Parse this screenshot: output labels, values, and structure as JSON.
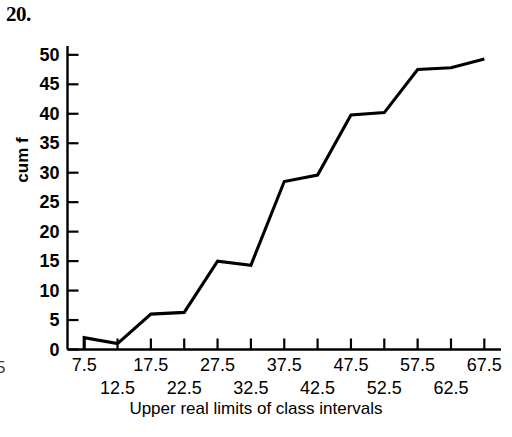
{
  "problem_number": "20.",
  "margin_artifact": "5",
  "chart_data": {
    "type": "line",
    "title": "",
    "xlabel": "Upper real limits of class intervals",
    "ylabel": "cum f",
    "x": [
      7.5,
      12.5,
      17.5,
      22.5,
      27.5,
      32.5,
      37.5,
      42.5,
      47.5,
      52.5,
      57.5,
      62.5,
      67.5
    ],
    "values": [
      2,
      1,
      6,
      6.3,
      15,
      14.3,
      28.5,
      29.6,
      39.8,
      40.2,
      47.5,
      47.8,
      49.3
    ],
    "categories": [
      "7.5",
      "12.5",
      "17.5",
      "22.5",
      "27.5",
      "32.5",
      "37.5",
      "42.5",
      "47.5",
      "52.5",
      "57.5",
      "62.5",
      "67.5"
    ],
    "baseline_stub": {
      "x": 7.5,
      "from": 0,
      "to": 2
    },
    "xlim": [
      5.0,
      70.0
    ],
    "ylim": [
      0,
      51.5
    ],
    "xticks": [
      7.5,
      12.5,
      17.5,
      22.5,
      27.5,
      32.5,
      37.5,
      42.5,
      47.5,
      52.5,
      57.5,
      62.5,
      67.5
    ],
    "xtick_labels": [
      "7.5",
      "12.5",
      "17.5",
      "22.5",
      "27.5",
      "32.5",
      "37.5",
      "42.5",
      "47.5",
      "52.5",
      "57.5",
      "62.5",
      "67.5"
    ],
    "yticks": [
      0,
      5,
      10,
      15,
      20,
      25,
      30,
      35,
      40,
      45,
      50
    ],
    "ytick_labels": [
      "0",
      "5",
      "10",
      "15",
      "20",
      "25",
      "30",
      "35",
      "40",
      "45",
      "50"
    ],
    "grid": false,
    "legend": false,
    "line_color": "#000000",
    "axis_color": "#000000"
  }
}
